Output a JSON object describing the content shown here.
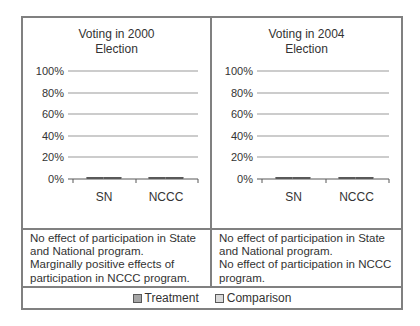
{
  "figure": {
    "kind": "two-panel bar chart comparison with notes and shared legend"
  },
  "legend": {
    "items": [
      {
        "label": "Treatment",
        "color": "#a6a6a6"
      },
      {
        "label": "Comparison",
        "color": "#d9d9d9"
      }
    ]
  },
  "notes": [
    {
      "lines": [
        "No effect of participation in State and National program.",
        "Marginally positive effects of participation in NCCC program."
      ]
    },
    {
      "lines": [
        "No effect of participation in State and National program.",
        "No effect of participation in NCCC program."
      ]
    }
  ],
  "chart_data": [
    {
      "type": "bar",
      "title": "Voting in 2000 Election",
      "categories": [
        "SN",
        "NCCC"
      ],
      "series": [
        {
          "name": "Treatment",
          "values": [
            76,
            78
          ],
          "color": "#a6a6a6"
        },
        {
          "name": "Comparison",
          "values": [
            75,
            67
          ],
          "color": "#d9d9d9"
        }
      ],
      "xlabel": "",
      "ylabel": "",
      "ylim": [
        0,
        100
      ],
      "grid": true,
      "legend_position": "bottom-shared",
      "y_ticks": [
        {
          "label": "100%",
          "value": 100
        },
        {
          "label": "80%",
          "value": 80
        },
        {
          "label": "60%",
          "value": 60
        },
        {
          "label": "40%",
          "value": 40
        },
        {
          "label": "20%",
          "value": 20
        },
        {
          "label": "0%",
          "value": 0
        }
      ]
    },
    {
      "type": "bar",
      "title": "Voting in 2004 Election",
      "categories": [
        "SN",
        "NCCC"
      ],
      "series": [
        {
          "name": "Treatment",
          "values": [
            86,
            91
          ],
          "color": "#a6a6a6"
        },
        {
          "name": "Comparison",
          "values": [
            88,
            93
          ],
          "color": "#d9d9d9"
        }
      ],
      "xlabel": "",
      "ylabel": "",
      "ylim": [
        0,
        100
      ],
      "grid": true,
      "legend_position": "bottom-shared",
      "y_ticks": [
        {
          "label": "100%",
          "value": 100
        },
        {
          "label": "80%",
          "value": 80
        },
        {
          "label": "60%",
          "value": 60
        },
        {
          "label": "40%",
          "value": 40
        },
        {
          "label": "20%",
          "value": 20
        },
        {
          "label": "0%",
          "value": 0
        }
      ]
    }
  ]
}
